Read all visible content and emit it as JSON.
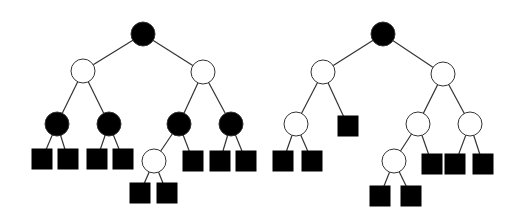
{
  "diagram": {
    "type": "binary-tree-pair",
    "colors": {
      "black_node": "#000000",
      "white_node": "#ffffff",
      "stroke": "#333333",
      "leaf": "#000000",
      "background": "#ffffff"
    },
    "trees": [
      {
        "id": "left-tree",
        "nodes": [
          {
            "id": "a",
            "kind": "circle",
            "fill": "black",
            "x": 143,
            "y": 34
          },
          {
            "id": "b",
            "kind": "circle",
            "fill": "white",
            "x": 83,
            "y": 71
          },
          {
            "id": "c",
            "kind": "circle",
            "fill": "white",
            "x": 203,
            "y": 72
          },
          {
            "id": "d",
            "kind": "circle",
            "fill": "black",
            "x": 57,
            "y": 124
          },
          {
            "id": "e",
            "kind": "circle",
            "fill": "black",
            "x": 109,
            "y": 124
          },
          {
            "id": "f",
            "kind": "circle",
            "fill": "black",
            "x": 179,
            "y": 124
          },
          {
            "id": "g",
            "kind": "circle",
            "fill": "black",
            "x": 231,
            "y": 124
          },
          {
            "id": "h",
            "kind": "square",
            "x": 42,
            "y": 159
          },
          {
            "id": "i",
            "kind": "square",
            "x": 68,
            "y": 159
          },
          {
            "id": "j",
            "kind": "square",
            "x": 97,
            "y": 159
          },
          {
            "id": "k",
            "kind": "square",
            "x": 123,
            "y": 159
          },
          {
            "id": "l",
            "kind": "circle",
            "fill": "white",
            "x": 154,
            "y": 161
          },
          {
            "id": "m",
            "kind": "square",
            "x": 193,
            "y": 161
          },
          {
            "id": "n",
            "kind": "square",
            "x": 220,
            "y": 161
          },
          {
            "id": "o",
            "kind": "square",
            "x": 246,
            "y": 161
          },
          {
            "id": "p",
            "kind": "square",
            "x": 140,
            "y": 193
          },
          {
            "id": "q",
            "kind": "square",
            "x": 167,
            "y": 193
          }
        ],
        "edges": [
          [
            "a",
            "b"
          ],
          [
            "a",
            "c"
          ],
          [
            "b",
            "d"
          ],
          [
            "b",
            "e"
          ],
          [
            "c",
            "f"
          ],
          [
            "c",
            "g"
          ],
          [
            "d",
            "h"
          ],
          [
            "d",
            "i"
          ],
          [
            "e",
            "j"
          ],
          [
            "e",
            "k"
          ],
          [
            "f",
            "l"
          ],
          [
            "f",
            "m"
          ],
          [
            "g",
            "n"
          ],
          [
            "g",
            "o"
          ],
          [
            "l",
            "p"
          ],
          [
            "l",
            "q"
          ]
        ]
      },
      {
        "id": "right-tree",
        "nodes": [
          {
            "id": "a",
            "kind": "circle",
            "fill": "black",
            "x": 383,
            "y": 34
          },
          {
            "id": "b",
            "kind": "circle",
            "fill": "white",
            "x": 323,
            "y": 72
          },
          {
            "id": "c",
            "kind": "circle",
            "fill": "white",
            "x": 443,
            "y": 74
          },
          {
            "id": "d",
            "kind": "circle",
            "fill": "white",
            "x": 296,
            "y": 124
          },
          {
            "id": "e",
            "kind": "square",
            "x": 348,
            "y": 126
          },
          {
            "id": "f",
            "kind": "circle",
            "fill": "white",
            "x": 418,
            "y": 124
          },
          {
            "id": "g",
            "kind": "circle",
            "fill": "white",
            "x": 470,
            "y": 124
          },
          {
            "id": "h",
            "kind": "square",
            "x": 283,
            "y": 161
          },
          {
            "id": "i",
            "kind": "square",
            "x": 312,
            "y": 161
          },
          {
            "id": "j",
            "kind": "circle",
            "fill": "white",
            "x": 394,
            "y": 161
          },
          {
            "id": "k",
            "kind": "square",
            "x": 432,
            "y": 164
          },
          {
            "id": "l",
            "kind": "square",
            "x": 455,
            "y": 164
          },
          {
            "id": "m",
            "kind": "square",
            "x": 483,
            "y": 164
          },
          {
            "id": "n",
            "kind": "square",
            "x": 380,
            "y": 196
          },
          {
            "id": "o",
            "kind": "square",
            "x": 411,
            "y": 196
          }
        ],
        "edges": [
          [
            "a",
            "b"
          ],
          [
            "a",
            "c"
          ],
          [
            "b",
            "d"
          ],
          [
            "b",
            "e"
          ],
          [
            "c",
            "f"
          ],
          [
            "c",
            "g"
          ],
          [
            "d",
            "h"
          ],
          [
            "d",
            "i"
          ],
          [
            "f",
            "j"
          ],
          [
            "f",
            "k"
          ],
          [
            "g",
            "l"
          ],
          [
            "g",
            "m"
          ],
          [
            "j",
            "n"
          ],
          [
            "j",
            "o"
          ]
        ]
      }
    ],
    "node_radius": 12,
    "leaf_size": 21
  }
}
